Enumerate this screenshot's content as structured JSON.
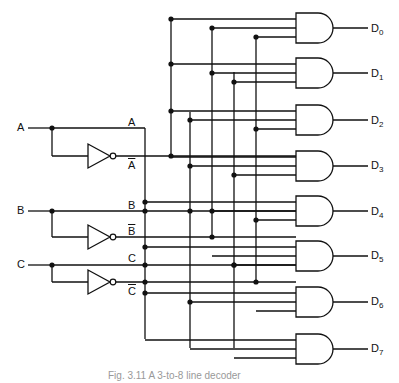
{
  "diagram": {
    "title": "3-to-8 line decoder",
    "inputs": [
      {
        "name": "A",
        "y": 128,
        "true_label": "A",
        "comp_label": "A",
        "comp_y": 156
      },
      {
        "name": "B",
        "y": 211,
        "true_label": "B",
        "comp_label": "B",
        "comp_y": 237
      },
      {
        "name": "C",
        "y": 265,
        "true_label": "C",
        "comp_label": "C",
        "comp_y": 282
      }
    ],
    "outputs": [
      {
        "label": "D",
        "sub": "0"
      },
      {
        "label": "D",
        "sub": "1"
      },
      {
        "label": "D",
        "sub": "2"
      },
      {
        "label": "D",
        "sub": "3"
      },
      {
        "label": "D",
        "sub": "4"
      },
      {
        "label": "D",
        "sub": "5"
      },
      {
        "label": "D",
        "sub": "6"
      },
      {
        "label": "D",
        "sub": "7"
      }
    ],
    "gate_type": "AND",
    "inverter_count": 3,
    "caption": "Fig. 3.11 A 3-to-8 line decoder"
  }
}
